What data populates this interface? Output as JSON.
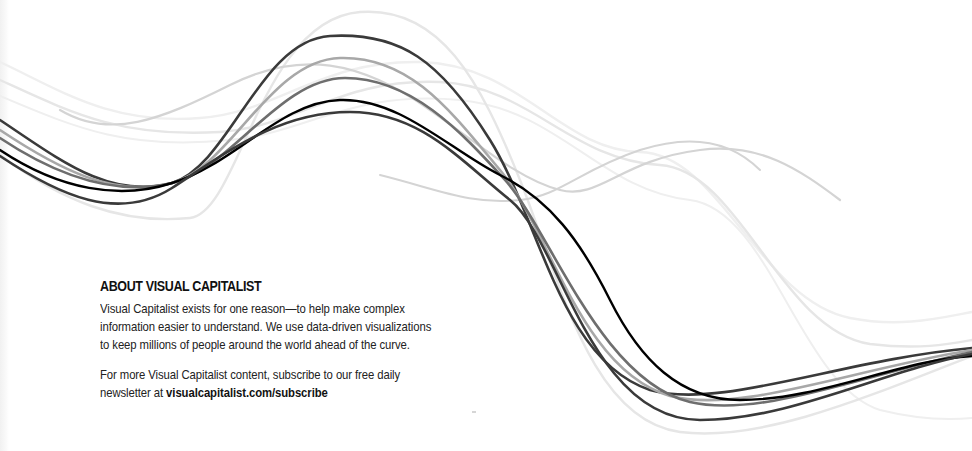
{
  "about": {
    "title": "ABOUT VISUAL CAPITALIST",
    "paragraph1": [
      "Visual Capitalist exists for one reason—to help make complex",
      "information easier to understand. We use data-driven visualizations",
      "to keep millions of people around the world ahead of the curve."
    ],
    "paragraph2_line1": "For more Visual Capitalist content, subscribe to our free daily",
    "paragraph2_line2_prefix": "newsletter at ",
    "paragraph2_link": "visualcapitalist.com/subscribe"
  },
  "decoration": {
    "name": "flowing-wave-lines",
    "line_colors": [
      "#000000",
      "#3a3a3a",
      "#6e6e6e",
      "#a8a8a8",
      "#d4d4d4",
      "#e6e6e6",
      "#efefef"
    ]
  }
}
